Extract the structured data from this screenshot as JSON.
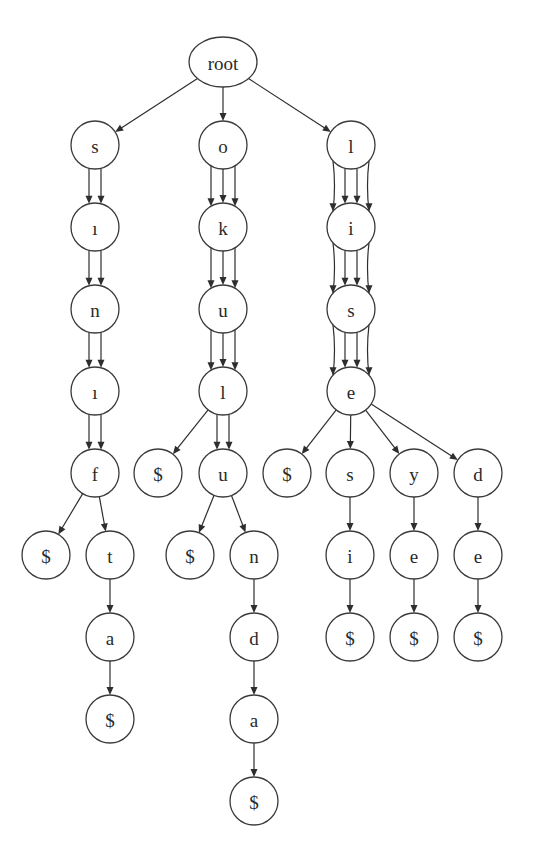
{
  "diagram": {
    "type": "trie",
    "root_label": "root",
    "nodes": [
      {
        "id": "root",
        "label": "root",
        "x": 223,
        "y": 62,
        "shape": "ellipse",
        "rx": 34,
        "ry": 25
      },
      {
        "id": "s1",
        "label": "s",
        "x": 95,
        "y": 145
      },
      {
        "id": "s2",
        "label": "ı",
        "x": 95,
        "y": 227
      },
      {
        "id": "s3",
        "label": "n",
        "x": 95,
        "y": 309
      },
      {
        "id": "s4",
        "label": "ı",
        "x": 95,
        "y": 391
      },
      {
        "id": "s5",
        "label": "f",
        "x": 95,
        "y": 473
      },
      {
        "id": "s6",
        "label": "$",
        "x": 46,
        "y": 555
      },
      {
        "id": "s7",
        "label": "t",
        "x": 110,
        "y": 555
      },
      {
        "id": "s8",
        "label": "a",
        "x": 110,
        "y": 637
      },
      {
        "id": "s9",
        "label": "$",
        "x": 110,
        "y": 719
      },
      {
        "id": "o1",
        "label": "o",
        "x": 223,
        "y": 145
      },
      {
        "id": "o2",
        "label": "k",
        "x": 223,
        "y": 227
      },
      {
        "id": "o3",
        "label": "u",
        "x": 223,
        "y": 309
      },
      {
        "id": "o4",
        "label": "l",
        "x": 223,
        "y": 391
      },
      {
        "id": "o5",
        "label": "$",
        "x": 158,
        "y": 473
      },
      {
        "id": "o6",
        "label": "u",
        "x": 223,
        "y": 473
      },
      {
        "id": "o7",
        "label": "$",
        "x": 190,
        "y": 555
      },
      {
        "id": "o8",
        "label": "n",
        "x": 254,
        "y": 555
      },
      {
        "id": "o9",
        "label": "d",
        "x": 254,
        "y": 637
      },
      {
        "id": "o10",
        "label": "a",
        "x": 254,
        "y": 719
      },
      {
        "id": "o11",
        "label": "$",
        "x": 254,
        "y": 801
      },
      {
        "id": "l1",
        "label": "l",
        "x": 351,
        "y": 145
      },
      {
        "id": "l2",
        "label": "i",
        "x": 351,
        "y": 227
      },
      {
        "id": "l3",
        "label": "s",
        "x": 351,
        "y": 309
      },
      {
        "id": "l4",
        "label": "e",
        "x": 351,
        "y": 391
      },
      {
        "id": "l5",
        "label": "$",
        "x": 287,
        "y": 473
      },
      {
        "id": "l6",
        "label": "s",
        "x": 350,
        "y": 473
      },
      {
        "id": "l7",
        "label": "y",
        "x": 414,
        "y": 473
      },
      {
        "id": "l8",
        "label": "d",
        "x": 478,
        "y": 473
      },
      {
        "id": "l9",
        "label": "i",
        "x": 350,
        "y": 555
      },
      {
        "id": "l10",
        "label": "e",
        "x": 414,
        "y": 555
      },
      {
        "id": "l11",
        "label": "e",
        "x": 478,
        "y": 555
      },
      {
        "id": "l12",
        "label": "$",
        "x": 350,
        "y": 637
      },
      {
        "id": "l13",
        "label": "$",
        "x": 414,
        "y": 637
      },
      {
        "id": "l14",
        "label": "$",
        "x": 478,
        "y": 637
      }
    ],
    "edges": [
      {
        "from": "root",
        "to": "s1",
        "count": 1
      },
      {
        "from": "root",
        "to": "o1",
        "count": 1
      },
      {
        "from": "root",
        "to": "l1",
        "count": 1
      },
      {
        "from": "s1",
        "to": "s2",
        "count": 2
      },
      {
        "from": "s2",
        "to": "s3",
        "count": 2
      },
      {
        "from": "s3",
        "to": "s4",
        "count": 2
      },
      {
        "from": "s4",
        "to": "s5",
        "count": 2
      },
      {
        "from": "s5",
        "to": "s6",
        "count": 1
      },
      {
        "from": "s5",
        "to": "s7",
        "count": 1
      },
      {
        "from": "s7",
        "to": "s8",
        "count": 1
      },
      {
        "from": "s8",
        "to": "s9",
        "count": 1
      },
      {
        "from": "o1",
        "to": "o2",
        "count": 3
      },
      {
        "from": "o2",
        "to": "o3",
        "count": 3
      },
      {
        "from": "o3",
        "to": "o4",
        "count": 3
      },
      {
        "from": "o4",
        "to": "o5",
        "count": 1
      },
      {
        "from": "o4",
        "to": "o6",
        "count": 2
      },
      {
        "from": "o6",
        "to": "o7",
        "count": 1
      },
      {
        "from": "o6",
        "to": "o8",
        "count": 1
      },
      {
        "from": "o8",
        "to": "o9",
        "count": 1
      },
      {
        "from": "o9",
        "to": "o10",
        "count": 1
      },
      {
        "from": "o10",
        "to": "o11",
        "count": 1
      },
      {
        "from": "l1",
        "to": "l2",
        "count": 4
      },
      {
        "from": "l2",
        "to": "l3",
        "count": 4
      },
      {
        "from": "l3",
        "to": "l4",
        "count": 4
      },
      {
        "from": "l4",
        "to": "l5",
        "count": 1
      },
      {
        "from": "l4",
        "to": "l6",
        "count": 1
      },
      {
        "from": "l4",
        "to": "l7",
        "count": 1
      },
      {
        "from": "l4",
        "to": "l8",
        "count": 1
      },
      {
        "from": "l6",
        "to": "l9",
        "count": 1
      },
      {
        "from": "l7",
        "to": "l10",
        "count": 1
      },
      {
        "from": "l8",
        "to": "l11",
        "count": 1
      },
      {
        "from": "l9",
        "to": "l12",
        "count": 1
      },
      {
        "from": "l10",
        "to": "l13",
        "count": 1
      },
      {
        "from": "l11",
        "to": "l14",
        "count": 1
      }
    ],
    "node_radius": 24,
    "colors": {
      "stroke": "#3a3a3a",
      "fill": "#ffffff",
      "text": "#2a2a2a",
      "background": "#ffffff"
    }
  }
}
